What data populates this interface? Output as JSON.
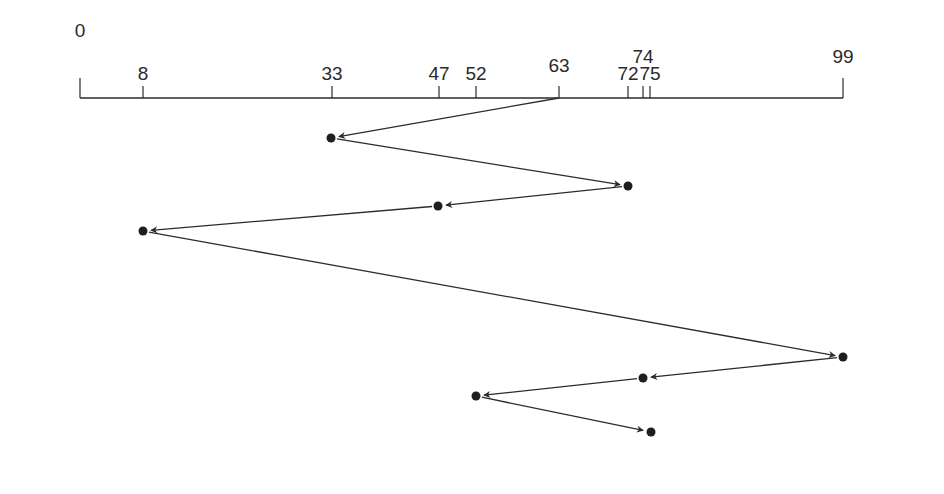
{
  "diagram": {
    "type": "disk-head-scheduling-sequence",
    "axis": {
      "min": 0,
      "max": 99,
      "ticks": [
        {
          "value": 0,
          "label": "0",
          "x": 80,
          "label_y": 37
        },
        {
          "value": 8,
          "label": "8",
          "x": 143,
          "label_y": 80
        },
        {
          "value": 33,
          "label": "33",
          "x": 332,
          "label_y": 80
        },
        {
          "value": 47,
          "label": "47",
          "x": 439,
          "label_y": 80
        },
        {
          "value": 52,
          "label": "52",
          "x": 476,
          "label_y": 80
        },
        {
          "value": 63,
          "label": "63",
          "x": 559,
          "label_y": 72
        },
        {
          "value": 72,
          "label": "72",
          "x": 628,
          "label_y": 80
        },
        {
          "value": 74,
          "label": "74",
          "x": 643,
          "label_y": 63
        },
        {
          "value": 75,
          "label": "75",
          "x": 650,
          "label_y": 80
        },
        {
          "value": 99,
          "label": "99",
          "x": 843,
          "label_y": 63
        }
      ]
    },
    "start": {
      "value": 63,
      "x": 559,
      "y": 98
    },
    "sequence": [
      {
        "value": 33,
        "x": 331,
        "y": 138
      },
      {
        "value": 72,
        "x": 628,
        "y": 186
      },
      {
        "value": 47,
        "x": 438,
        "y": 206
      },
      {
        "value": 8,
        "x": 143,
        "y": 231
      },
      {
        "value": 99,
        "x": 843,
        "y": 357
      },
      {
        "value": 74,
        "x": 643,
        "y": 378
      },
      {
        "value": 52,
        "x": 476,
        "y": 396
      },
      {
        "value": 75,
        "x": 651,
        "y": 432
      }
    ],
    "colors": {
      "line": "#2b2b2b",
      "dot": "#1e1e1e",
      "background": "#ffffff"
    }
  }
}
